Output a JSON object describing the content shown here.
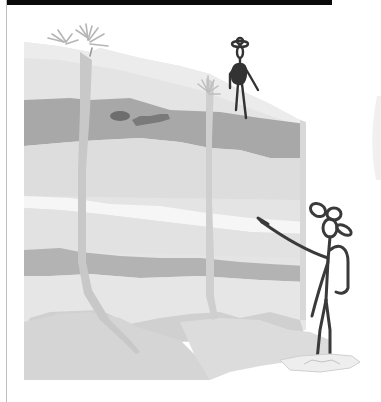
{
  "image": {
    "title": "",
    "description": "Cartoon illustration of a layered rock cliff (sedimentary strata) with a stick-figure person standing on top and another hiker with a hat and backpack standing in water at the base, pointing at the cliff layers. A dark fossil-like nodule is embedded in the upper dark stratum.",
    "elements": {
      "top_bar": "black header strip",
      "cliff": "layered rock face with alternating light and dark gray bands",
      "fossil": "dark rounded objects in upper dark band",
      "plants": [
        "grass tuft at top-left",
        "small grass tuft near standing figure"
      ],
      "figure_top": "stick figure with hat standing on cliff top",
      "figure_bottom": "stick figure hiker with wide-brim hat and backpack pointing at cliff",
      "water": "puddle at hiker's feet"
    }
  },
  "colors": {
    "background": "#ffffff",
    "top_bar": "#0a0a0a",
    "rock_light": "#e6e6e6",
    "rock_mid": "#d2d2d2",
    "rock_dark": "#a9a9a9",
    "rock_white_band": "#f4f4f4",
    "fossil": "#6e6e6e",
    "ink": "#3a3a3a",
    "grass": "#b8b8b8",
    "water": "#e8e8e8"
  }
}
